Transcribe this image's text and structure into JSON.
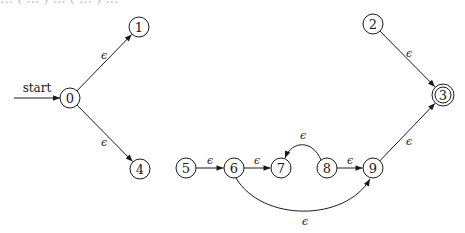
{
  "header_fragment": "… ( … )   … ( … ) …",
  "diagram": {
    "type": "epsilon-NFA",
    "start_label": "start",
    "epsilon": "ϵ",
    "nodes": [
      {
        "id": "0",
        "label": "0",
        "x": 70,
        "y": 98,
        "r": 10,
        "accepting": false,
        "start": true
      },
      {
        "id": "1",
        "label": "1",
        "x": 139,
        "y": 27,
        "r": 10,
        "accepting": false
      },
      {
        "id": "4",
        "label": "4",
        "x": 140,
        "y": 169,
        "r": 10,
        "accepting": false
      },
      {
        "id": "2",
        "label": "2",
        "x": 373,
        "y": 24,
        "r": 10,
        "accepting": false
      },
      {
        "id": "3",
        "label": "3",
        "x": 443,
        "y": 95,
        "r": 11,
        "accepting": true
      },
      {
        "id": "5",
        "label": "5",
        "x": 186,
        "y": 168,
        "r": 10,
        "accepting": false
      },
      {
        "id": "6",
        "label": "6",
        "x": 234,
        "y": 168,
        "r": 10,
        "accepting": false
      },
      {
        "id": "7",
        "label": "7",
        "x": 281,
        "y": 168,
        "r": 10,
        "accepting": false
      },
      {
        "id": "8",
        "label": "8",
        "x": 327,
        "y": 168,
        "r": 10,
        "accepting": false
      },
      {
        "id": "9",
        "label": "9",
        "x": 373,
        "y": 168,
        "r": 10,
        "accepting": false
      }
    ],
    "edges": [
      {
        "from": "0",
        "to": "1",
        "label": "ϵ",
        "lx": 104,
        "ly": 55
      },
      {
        "from": "0",
        "to": "4",
        "label": "ϵ",
        "lx": 104,
        "ly": 142
      },
      {
        "from": "2",
        "to": "3",
        "label": "ϵ",
        "lx": 409,
        "ly": 53
      },
      {
        "from": "9",
        "to": "3",
        "label": "ϵ",
        "lx": 409,
        "ly": 141
      },
      {
        "from": "5",
        "to": "6",
        "label": "ϵ",
        "lx": 210,
        "ly": 160
      },
      {
        "from": "6",
        "to": "7",
        "label": "ϵ",
        "lx": 257,
        "ly": 160
      },
      {
        "from": "8",
        "to": "9",
        "label": "ϵ",
        "lx": 350,
        "ly": 160
      },
      {
        "from": "8",
        "to": "7",
        "label": "ϵ",
        "lx": 303,
        "ly": 135,
        "curve": "M321,160 C313,140 292,140 285,158"
      },
      {
        "from": "6",
        "to": "9",
        "label": "ϵ",
        "lx": 305,
        "ly": 221,
        "curve": "M236,178 C262,222 345,222 370,179"
      }
    ],
    "start_arrow": {
      "x1": 14,
      "y1": 98,
      "x2": 60,
      "y2": 98,
      "label_x": 37,
      "label_y": 92
    }
  }
}
